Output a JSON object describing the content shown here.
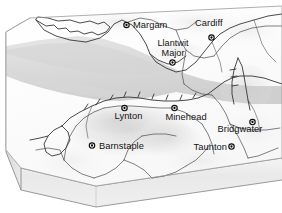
{
  "figure": {
    "kind": "3d-block-diagram-relief-map",
    "region": "Bristol Channel",
    "alt": "Oblique three-dimensional block diagram of the Bristol Channel showing South Wales coast and the North Devon / Somerset coast with seven named settlements"
  },
  "colors": {
    "land": "#fdfdfd",
    "sea": "#dcdcdc",
    "sea_deep": "#d2d2d2",
    "relief_light": "#f2f2f2",
    "relief_mid": "#e3e3e3",
    "relief_dark": "#cfcfcf",
    "block_front": "#ececec",
    "block_side": "#e0e0e0",
    "block_edge": "#8d8d8d",
    "coast_stroke": "#2b2b2b",
    "border_stroke": "#4a4a4a",
    "label_text": "#141414",
    "marker_fill": "#ffffff",
    "marker_stroke": "#0d0d0d",
    "background": "#ffffff"
  },
  "cities": [
    {
      "id": "margam",
      "name": "Margam",
      "marker": {
        "x": 126.5,
        "y": 25.0
      },
      "label": {
        "x": 133.0,
        "y": 28.4,
        "anchor": "start",
        "lines": [
          "Margam"
        ]
      }
    },
    {
      "id": "cardiff",
      "name": "Cardiff",
      "marker": {
        "x": 211.5,
        "y": 37.5
      },
      "label": {
        "x": 195.0,
        "y": 25.6,
        "anchor": "start",
        "lines": [
          "Cardiff"
        ]
      }
    },
    {
      "id": "llantwit-major",
      "name": "Llantwit Major",
      "marker": {
        "x": 172.5,
        "y": 62.5
      },
      "label": {
        "x": 173.0,
        "y": 46.0,
        "anchor": "middle",
        "lines": [
          "Llantwit",
          "Major"
        ]
      }
    },
    {
      "id": "lynton",
      "name": "Lynton",
      "marker": {
        "x": 124.5,
        "y": 108.0
      },
      "label": {
        "x": 128.5,
        "y": 118.6,
        "anchor": "middle",
        "lines": [
          "Lynton"
        ]
      }
    },
    {
      "id": "minehead",
      "name": "Minehead",
      "marker": {
        "x": 174.5,
        "y": 108.0
      },
      "label": {
        "x": 186.0,
        "y": 119.6,
        "anchor": "middle",
        "lines": [
          "Minehead"
        ]
      }
    },
    {
      "id": "bridgwater",
      "name": "Bridgwater",
      "marker": {
        "x": 252.5,
        "y": 122.0
      },
      "label": {
        "x": 240.0,
        "y": 132.4,
        "anchor": "middle",
        "lines": [
          "Bridgwater"
        ]
      }
    },
    {
      "id": "barnstaple",
      "name": "Barnstaple",
      "marker": {
        "x": 92.0,
        "y": 145.5
      },
      "label": {
        "x": 99.0,
        "y": 148.9,
        "anchor": "start",
        "lines": [
          "Barnstaple"
        ]
      }
    },
    {
      "id": "taunton",
      "name": "Taunton",
      "marker": {
        "x": 231.5,
        "y": 146.5
      },
      "label": {
        "x": 227.0,
        "y": 149.9,
        "anchor": "end",
        "lines": [
          "Taunton"
        ]
      }
    }
  ]
}
